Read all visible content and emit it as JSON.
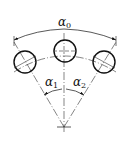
{
  "diagram": {
    "type": "angular-hole-pattern",
    "labels": {
      "total_angle": {
        "symbol": "α",
        "sub": "0"
      },
      "left_angle": {
        "symbol": "α",
        "sub": "1"
      },
      "right_angle": {
        "symbol": "α",
        "sub": "2"
      }
    },
    "holes": [
      {
        "name": "left-hole",
        "cx": 25,
        "cy": 62,
        "r": 11
      },
      {
        "name": "middle-hole",
        "cx": 65,
        "cy": 51,
        "r": 11
      },
      {
        "name": "right-hole",
        "cx": 104,
        "cy": 62,
        "r": 11
      }
    ],
    "center_point": {
      "x": 64,
      "y": 127
    },
    "line_color": "#111111"
  }
}
